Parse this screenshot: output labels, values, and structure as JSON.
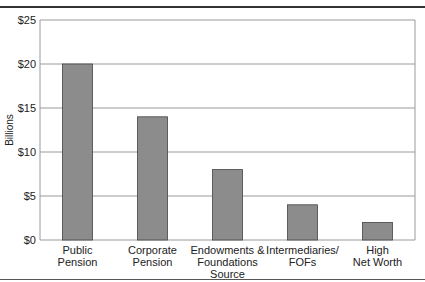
{
  "chart_data": {
    "type": "bar",
    "title": "",
    "xlabel": "Source",
    "ylabel": "Billions",
    "ylim": [
      0,
      25
    ],
    "yticks": [
      0,
      5,
      10,
      15,
      20,
      25
    ],
    "ytick_labels": [
      "$0",
      "$5",
      "$10",
      "$15",
      "$20",
      "$25"
    ],
    "grid": true,
    "categories": [
      "Public Pension",
      "Corporate Pension",
      "Endowments & Foundations",
      "Intermediaries/ FOFs",
      "High Net Worth"
    ],
    "category_lines": [
      [
        "Public",
        "Pension"
      ],
      [
        "Corporate",
        "Pension"
      ],
      [
        "Endowments &",
        "Foundations",
        "Source"
      ],
      [
        "Intermediaries/",
        "FOFs"
      ],
      [
        "High",
        "Net Worth"
      ]
    ],
    "values": [
      20,
      14,
      8,
      4,
      2
    ],
    "bar_color": "#8c8c8c",
    "legend": null
  }
}
